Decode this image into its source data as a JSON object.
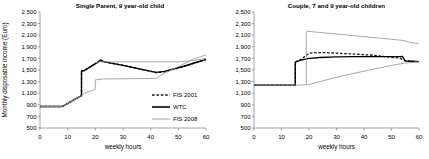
{
  "figure": {
    "panels": [
      {
        "name": "single-parent",
        "title": "Single Parent, 9 year-old child",
        "has_legend": true
      },
      {
        "name": "couple",
        "title": "Couple, 7 and 9 year-old children",
        "has_legend": false
      }
    ],
    "legend": {
      "items": [
        {
          "label": "FIS 2001",
          "style": "dashed",
          "color": "#1a1a1a"
        },
        {
          "label": "WTC",
          "style": "solid-thick",
          "color": "#000000"
        },
        {
          "label": "FIS 2008",
          "style": "solid-thin",
          "color": "#9a9a9a"
        }
      ]
    }
  },
  "chart_data": [
    {
      "type": "line",
      "title": "Single Parent, 9 year-old child",
      "xlabel": "weekly hours",
      "ylabel": "Monthly disposable income (Euro)",
      "xlim": [
        0,
        60
      ],
      "ylim": [
        500,
        2500
      ],
      "xticks": [
        0,
        10,
        20,
        30,
        40,
        50,
        60
      ],
      "yticks": [
        500,
        700,
        900,
        1100,
        1300,
        1500,
        1700,
        1900,
        2100,
        2300,
        2500
      ],
      "ytick_labels": [
        "500",
        "700",
        "900",
        "1,100",
        "1,300",
        "1,500",
        "1,700",
        "1,900",
        "2,100",
        "2,300",
        "2,500"
      ],
      "xtick_labels": [
        "0",
        "10",
        "20",
        "30",
        "40",
        "50",
        "60"
      ],
      "grid": false,
      "legend_position": "inside-lower-right",
      "series": [
        {
          "name": "FIS 2001",
          "style": "dashed",
          "color": "#1a1a1a",
          "x": [
            0,
            8,
            15,
            15,
            16,
            22,
            23,
            30,
            42,
            45,
            52,
            56,
            60
          ],
          "y": [
            870,
            870,
            1060,
            1480,
            1490,
            1665,
            1640,
            1580,
            1455,
            1470,
            1560,
            1620,
            1680
          ]
        },
        {
          "name": "WTC",
          "style": "solid-thick",
          "color": "#000000",
          "x": [
            0,
            8,
            15,
            15,
            16,
            22,
            23,
            30,
            42,
            45,
            52,
            56,
            60
          ],
          "y": [
            870,
            870,
            1060,
            1480,
            1490,
            1670,
            1645,
            1580,
            1460,
            1475,
            1565,
            1625,
            1685
          ]
        },
        {
          "name": "FIS 2008",
          "style": "solid-thin",
          "color": "#9a9a9a",
          "x": [
            0,
            8,
            15,
            16,
            19,
            20,
            20,
            23,
            42,
            44,
            50,
            55,
            60
          ],
          "y": [
            870,
            870,
            1060,
            1100,
            1150,
            1170,
            1330,
            1345,
            1355,
            1420,
            1560,
            1680,
            1760
          ]
        },
        {
          "name": "FIS 2008 upper",
          "style": "solid-thin",
          "color": "#9a9a9a",
          "x": [
            20,
            22,
            23,
            30,
            42,
            43,
            50,
            55,
            60
          ],
          "y": [
            1625,
            1640,
            1640,
            1640,
            1640,
            1640,
            1640,
            1660,
            1700
          ]
        }
      ]
    },
    {
      "type": "line",
      "title": "Couple, 7 and 9 year-old children",
      "xlabel": "weekly hours",
      "ylabel": "",
      "xlim": [
        0,
        60
      ],
      "ylim": [
        500,
        2500
      ],
      "xticks": [
        0,
        10,
        20,
        30,
        40,
        50,
        60
      ],
      "yticks": [
        500,
        700,
        900,
        1100,
        1300,
        1500,
        1700,
        1900,
        2100,
        2300,
        2500
      ],
      "ytick_labels": [
        "500",
        "700",
        "900",
        "1,100",
        "1,300",
        "1,500",
        "1,700",
        "1,900",
        "2,100",
        "2,300",
        "2,500"
      ],
      "xtick_labels": [
        "0",
        "10",
        "20",
        "30",
        "40",
        "50",
        "60"
      ],
      "grid": false,
      "legend_position": "none",
      "series": [
        {
          "name": "FIS 2001",
          "style": "dashed",
          "color": "#1a1a1a",
          "x": [
            0,
            15,
            15,
            17,
            20,
            22,
            26,
            30,
            36,
            42,
            48,
            53,
            55,
            60
          ],
          "y": [
            1240,
            1240,
            1640,
            1680,
            1790,
            1800,
            1800,
            1790,
            1775,
            1760,
            1730,
            1705,
            1660,
            1645
          ]
        },
        {
          "name": "WTC",
          "style": "solid-thick",
          "color": "#000000",
          "x": [
            0,
            15,
            15,
            17,
            20,
            24,
            30,
            36,
            42,
            48,
            53,
            54,
            55,
            60
          ],
          "y": [
            1240,
            1240,
            1635,
            1670,
            1700,
            1715,
            1725,
            1730,
            1730,
            1730,
            1730,
            1735,
            1655,
            1645
          ]
        },
        {
          "name": "FIS 2008 upper",
          "style": "solid-thin",
          "color": "#9a9a9a",
          "x": [
            19,
            19,
            20,
            30,
            40,
            50,
            54,
            57,
            60
          ],
          "y": [
            1245,
            2165,
            2165,
            2120,
            2075,
            2030,
            2010,
            1975,
            1950
          ]
        },
        {
          "name": "FIS 2008 lower",
          "style": "solid-thin",
          "color": "#9a9a9a",
          "x": [
            0,
            15,
            19,
            20,
            30,
            40,
            50,
            55,
            60
          ],
          "y": [
            1240,
            1240,
            1245,
            1250,
            1375,
            1480,
            1580,
            1620,
            1640
          ]
        }
      ]
    }
  ]
}
